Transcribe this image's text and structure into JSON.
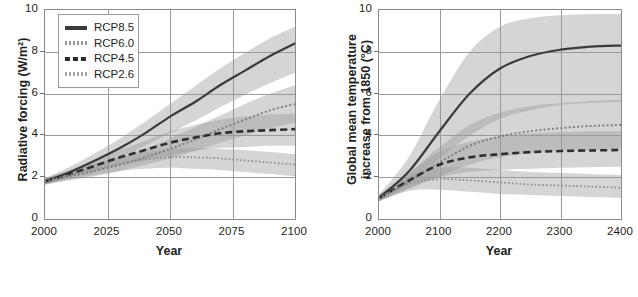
{
  "figure": {
    "scenario_names": [
      "RCP8.5",
      "RCP6.0",
      "RCP4.5",
      "RCP2.6"
    ],
    "colors": {
      "rcp85": "#3b3b3b",
      "rcp60": "#7e7e7e",
      "rcp45": "#2e2e2e",
      "rcp26": "#8e8e8e",
      "band_dark": "#9b9b9b",
      "band_light": "#c9c9c9",
      "grid": "#9a9a9a",
      "frame": "#8a8a8a",
      "text": "#231f20"
    }
  },
  "chart_data": [
    {
      "type": "line",
      "panel": "left",
      "title": "",
      "xlabel": "Year",
      "ylabel": "Radiative forcing (W/m²)",
      "xlim": [
        2000,
        2100
      ],
      "ylim": [
        0,
        10
      ],
      "xticks": [
        2000,
        2025,
        2050,
        2075,
        2100
      ],
      "yticks": [
        0,
        2,
        4,
        6,
        8,
        10
      ],
      "grid": true,
      "legend_position": "top-left",
      "x": [
        2000,
        2010,
        2020,
        2030,
        2040,
        2050,
        2060,
        2070,
        2080,
        2090,
        2100
      ],
      "series": [
        {
          "name": "RCP8.5",
          "style": "solid",
          "color": "#3b3b3b",
          "values": [
            1.8,
            2.25,
            2.8,
            3.4,
            4.1,
            4.9,
            5.6,
            6.4,
            7.1,
            7.8,
            8.4
          ],
          "band_low": [
            1.65,
            2.0,
            2.45,
            2.95,
            3.5,
            4.1,
            4.7,
            5.35,
            5.95,
            6.5,
            7.0
          ],
          "band_high": [
            1.95,
            2.5,
            3.15,
            3.85,
            4.65,
            5.5,
            6.35,
            7.2,
            7.95,
            8.65,
            9.2
          ]
        },
        {
          "name": "RCP6.0",
          "style": "dotted",
          "color": "#7e7e7e",
          "values": [
            1.8,
            2.05,
            2.3,
            2.6,
            2.95,
            3.35,
            3.8,
            4.3,
            4.75,
            5.2,
            5.5
          ],
          "band_low": [
            1.65,
            1.85,
            2.05,
            2.3,
            2.6,
            2.9,
            3.25,
            3.65,
            4.0,
            4.35,
            4.6
          ],
          "band_high": [
            1.95,
            2.3,
            2.6,
            2.95,
            3.35,
            3.85,
            4.4,
            4.95,
            5.5,
            6.0,
            6.4
          ]
        },
        {
          "name": "RCP4.5",
          "style": "dashed",
          "color": "#2e2e2e",
          "values": [
            1.8,
            2.15,
            2.55,
            2.95,
            3.3,
            3.65,
            3.9,
            4.1,
            4.2,
            4.25,
            4.3
          ],
          "band_low": [
            1.65,
            1.95,
            2.25,
            2.55,
            2.8,
            3.05,
            3.25,
            3.4,
            3.45,
            3.5,
            3.5
          ],
          "band_high": [
            1.95,
            2.35,
            2.8,
            3.3,
            3.75,
            4.2,
            4.5,
            4.75,
            4.9,
            5.0,
            5.05
          ]
        },
        {
          "name": "RCP2.6",
          "style": "fine-dotted",
          "color": "#8e8e8e",
          "values": [
            1.8,
            2.1,
            2.4,
            2.65,
            2.85,
            2.95,
            2.95,
            2.9,
            2.8,
            2.7,
            2.6
          ],
          "band_low": [
            1.65,
            1.9,
            2.1,
            2.3,
            2.4,
            2.45,
            2.4,
            2.35,
            2.25,
            2.15,
            2.05
          ],
          "band_high": [
            1.95,
            2.3,
            2.65,
            2.95,
            3.2,
            3.35,
            3.4,
            3.35,
            3.3,
            3.2,
            3.1
          ]
        }
      ]
    },
    {
      "type": "line",
      "panel": "right",
      "title": "",
      "xlabel": "Year",
      "ylabel": "Global mean temperature increase from 1850 (°C)",
      "ylabel_lines": [
        "Global mean temperature",
        "increase from 1850 (°C)"
      ],
      "xlim": [
        2000,
        2400
      ],
      "ylim": [
        0,
        10
      ],
      "xticks": [
        2000,
        2100,
        2200,
        2300,
        2400
      ],
      "yticks": [
        0,
        2,
        4,
        6,
        8,
        10
      ],
      "grid": true,
      "legend_position": "none",
      "x": [
        2000,
        2050,
        2100,
        2150,
        2200,
        2250,
        2300,
        2350,
        2400
      ],
      "series": [
        {
          "name": "RCP8.5",
          "style": "solid",
          "color": "#3b3b3b",
          "values": [
            1.0,
            2.3,
            4.2,
            6.0,
            7.2,
            7.8,
            8.1,
            8.25,
            8.3
          ],
          "band_low": [
            0.85,
            1.7,
            2.9,
            4.0,
            4.8,
            5.2,
            5.45,
            5.55,
            5.6
          ],
          "band_high": [
            1.15,
            3.0,
            5.7,
            8.0,
            9.2,
            9.6,
            9.75,
            9.8,
            9.8
          ]
        },
        {
          "name": "RCP6.0",
          "style": "dotted",
          "color": "#7e7e7e",
          "values": [
            1.0,
            1.8,
            2.7,
            3.5,
            3.95,
            4.2,
            4.35,
            4.45,
            4.5
          ],
          "band_low": [
            0.85,
            1.45,
            2.05,
            2.6,
            2.95,
            3.15,
            3.25,
            3.3,
            3.35
          ],
          "band_high": [
            1.15,
            2.2,
            3.45,
            4.5,
            5.1,
            5.4,
            5.55,
            5.65,
            5.7
          ]
        },
        {
          "name": "RCP4.5",
          "style": "dashed",
          "color": "#2e2e2e",
          "values": [
            1.0,
            1.85,
            2.6,
            2.95,
            3.1,
            3.2,
            3.25,
            3.28,
            3.3
          ],
          "band_low": [
            0.85,
            1.5,
            2.0,
            2.25,
            2.35,
            2.4,
            2.45,
            2.48,
            2.5
          ],
          "band_high": [
            1.15,
            2.2,
            3.2,
            3.7,
            3.95,
            4.1,
            4.15,
            4.2,
            4.2
          ]
        },
        {
          "name": "RCP2.6",
          "style": "fine-dotted",
          "color": "#8e8e8e",
          "values": [
            1.0,
            1.7,
            1.9,
            1.85,
            1.75,
            1.65,
            1.6,
            1.55,
            1.5
          ],
          "band_low": [
            0.85,
            1.35,
            1.4,
            1.3,
            1.2,
            1.15,
            1.1,
            1.05,
            1.0
          ],
          "band_high": [
            1.15,
            2.05,
            2.45,
            2.45,
            2.35,
            2.25,
            2.2,
            2.15,
            2.1
          ]
        }
      ]
    }
  ],
  "legend": {
    "items": [
      {
        "label": "RCP8.5",
        "style": "solid",
        "color": "#3b3b3b"
      },
      {
        "label": "RCP6.0",
        "style": "fine-dotted",
        "color": "#9a9a9a"
      },
      {
        "label": "RCP4.5",
        "style": "dashed",
        "color": "#2e2e2e"
      },
      {
        "label": "RCP2.6",
        "style": "fine-dotted",
        "color": "#a5a5a5"
      }
    ]
  }
}
